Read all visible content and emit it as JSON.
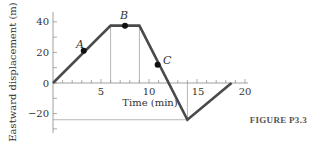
{
  "chart_data": {
    "type": "line",
    "title": "",
    "xlabel": "Time (min)",
    "ylabel": "Eastward displacement (m)",
    "xlim": [
      0,
      20
    ],
    "ylim": [
      -30,
      45
    ],
    "x_ticks": [
      5,
      10,
      15,
      20
    ],
    "y_ticks": [
      40,
      20,
      0,
      -20
    ],
    "grid": false,
    "series": [
      {
        "name": "displacement",
        "x": [
          0,
          6,
          9,
          14,
          18.6
        ],
        "y": [
          0,
          37.5,
          37.5,
          -24,
          0
        ]
      }
    ],
    "points": [
      {
        "label": "A",
        "x": 3.2,
        "y": 21
      },
      {
        "label": "B",
        "x": 7.5,
        "y": 37.5
      },
      {
        "label": "C",
        "x": 10.9,
        "y": 12
      }
    ],
    "guide_lines": {
      "vertical_at_x": [
        6,
        9,
        14
      ],
      "horizontal_at_y": [
        -24
      ]
    }
  },
  "labels": {
    "xlabel": "Time (min)",
    "ylabel": "Eastward displacement (m)",
    "caption": "FIGURE P3.3",
    "x_ticks": [
      "5",
      "10",
      "15",
      "20"
    ],
    "y_ticks": [
      "40",
      "20",
      "0",
      "−20"
    ],
    "points": [
      "A",
      "B",
      "C"
    ]
  },
  "colors": {
    "line": "#4a4a4a",
    "axis": "#777777",
    "text": "#333333"
  }
}
